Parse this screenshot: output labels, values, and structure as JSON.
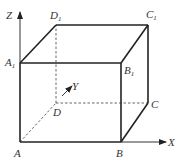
{
  "diagram": {
    "type": "cuboid-with-coordinate-axes",
    "axes": {
      "x_label": "X",
      "y_label": "Y",
      "z_label": "Z"
    },
    "vertices": {
      "A": {
        "name": "A",
        "sub": ""
      },
      "B": {
        "name": "B",
        "sub": ""
      },
      "C": {
        "name": "C",
        "sub": ""
      },
      "D": {
        "name": "D",
        "sub": ""
      },
      "A1": {
        "name": "A",
        "sub": "1"
      },
      "B1": {
        "name": "B",
        "sub": "1"
      },
      "C1": {
        "name": "C",
        "sub": "1"
      },
      "D1": {
        "name": "D",
        "sub": "1"
      }
    },
    "colors": {
      "edge": "#222222",
      "hidden_edge": "#555555",
      "background": "#ffffff"
    }
  }
}
